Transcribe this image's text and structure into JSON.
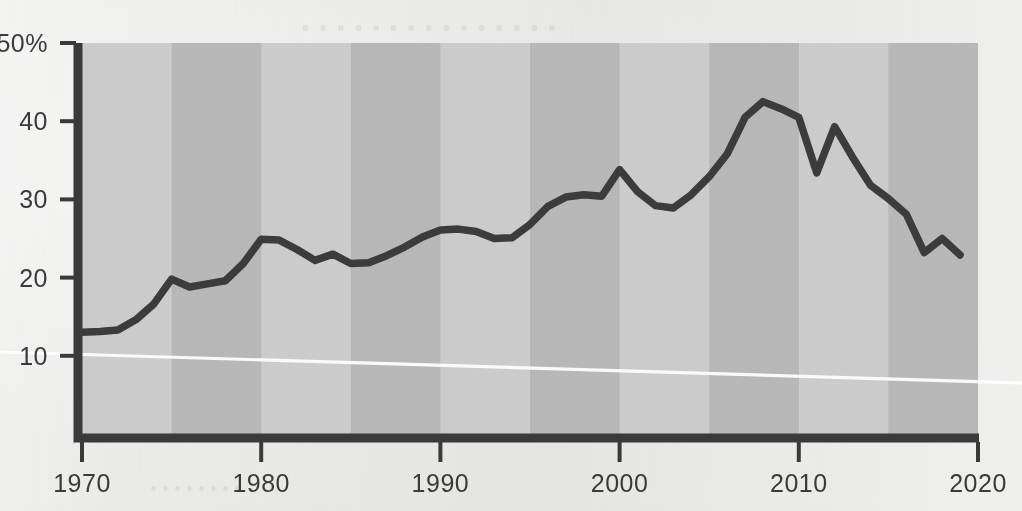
{
  "chart_data": {
    "type": "line",
    "title": "",
    "subtitle": "",
    "xlabel": "",
    "ylabel": "",
    "xlim": [
      1970,
      2020
    ],
    "ylim": [
      0,
      50
    ],
    "grid": false,
    "legend": null,
    "y_tick_labels": [
      "50%",
      "40",
      "30",
      "20",
      "10"
    ],
    "y_ticks": [
      50,
      40,
      30,
      20,
      10
    ],
    "x_tick_labels": [
      "1970",
      "1980",
      "1990",
      "2000",
      "2010",
      "2020"
    ],
    "x_ticks": [
      1970,
      1980,
      1990,
      2000,
      2010,
      2020
    ],
    "band_interval_years": 5,
    "band_start_year": 1975,
    "series": [
      {
        "name": "series-1",
        "color": "#3c3c3c",
        "x": [
          1970,
          1971,
          1972,
          1973,
          1974,
          1975,
          1976,
          1977,
          1978,
          1979,
          1980,
          1981,
          1982,
          1983,
          1984,
          1985,
          1986,
          1987,
          1988,
          1989,
          1990,
          1991,
          1992,
          1993,
          1994,
          1995,
          1996,
          1997,
          1998,
          1999,
          2000,
          2001,
          2002,
          2003,
          2004,
          2005,
          2006,
          2007,
          2008,
          2009,
          2010,
          2011,
          2012,
          2013,
          2014,
          2015,
          2016,
          2017,
          2018,
          2019
        ],
        "values": [
          13.0,
          13.1,
          13.3,
          14.6,
          16.6,
          19.8,
          18.8,
          19.2,
          19.6,
          21.8,
          24.9,
          24.8,
          23.6,
          22.2,
          23.0,
          21.8,
          21.9,
          22.8,
          23.9,
          25.2,
          26.1,
          26.2,
          25.9,
          25.0,
          25.1,
          26.8,
          29.1,
          30.3,
          30.6,
          30.4,
          33.8,
          31.0,
          29.2,
          28.9,
          30.6,
          32.9,
          35.8,
          40.5,
          42.5,
          41.6,
          40.5,
          33.4,
          39.3,
          35.4,
          31.8,
          30.1,
          28.1,
          23.2,
          25.0,
          22.9
        ]
      }
    ],
    "annotations": [
      {
        "name": "page-fold-line",
        "type": "white-diagonal-artifact"
      }
    ]
  },
  "ghost_text": {
    "line1": "• • • • • • • • • • • • • • •",
    "line2": "• • • • • • • • • •",
    "line3": "• • • • •",
    "line4": "• • • • • • • •",
    "line5": "• • • •"
  },
  "colors": {
    "paper": "#ebebe9",
    "band_light": "#cdcdcd",
    "band_dark": "#b9b9b9",
    "axis": "#3a3a3a",
    "line": "#3c3c3c",
    "fold_line": "#ffffff",
    "tick_text": "#3b3b3b"
  }
}
